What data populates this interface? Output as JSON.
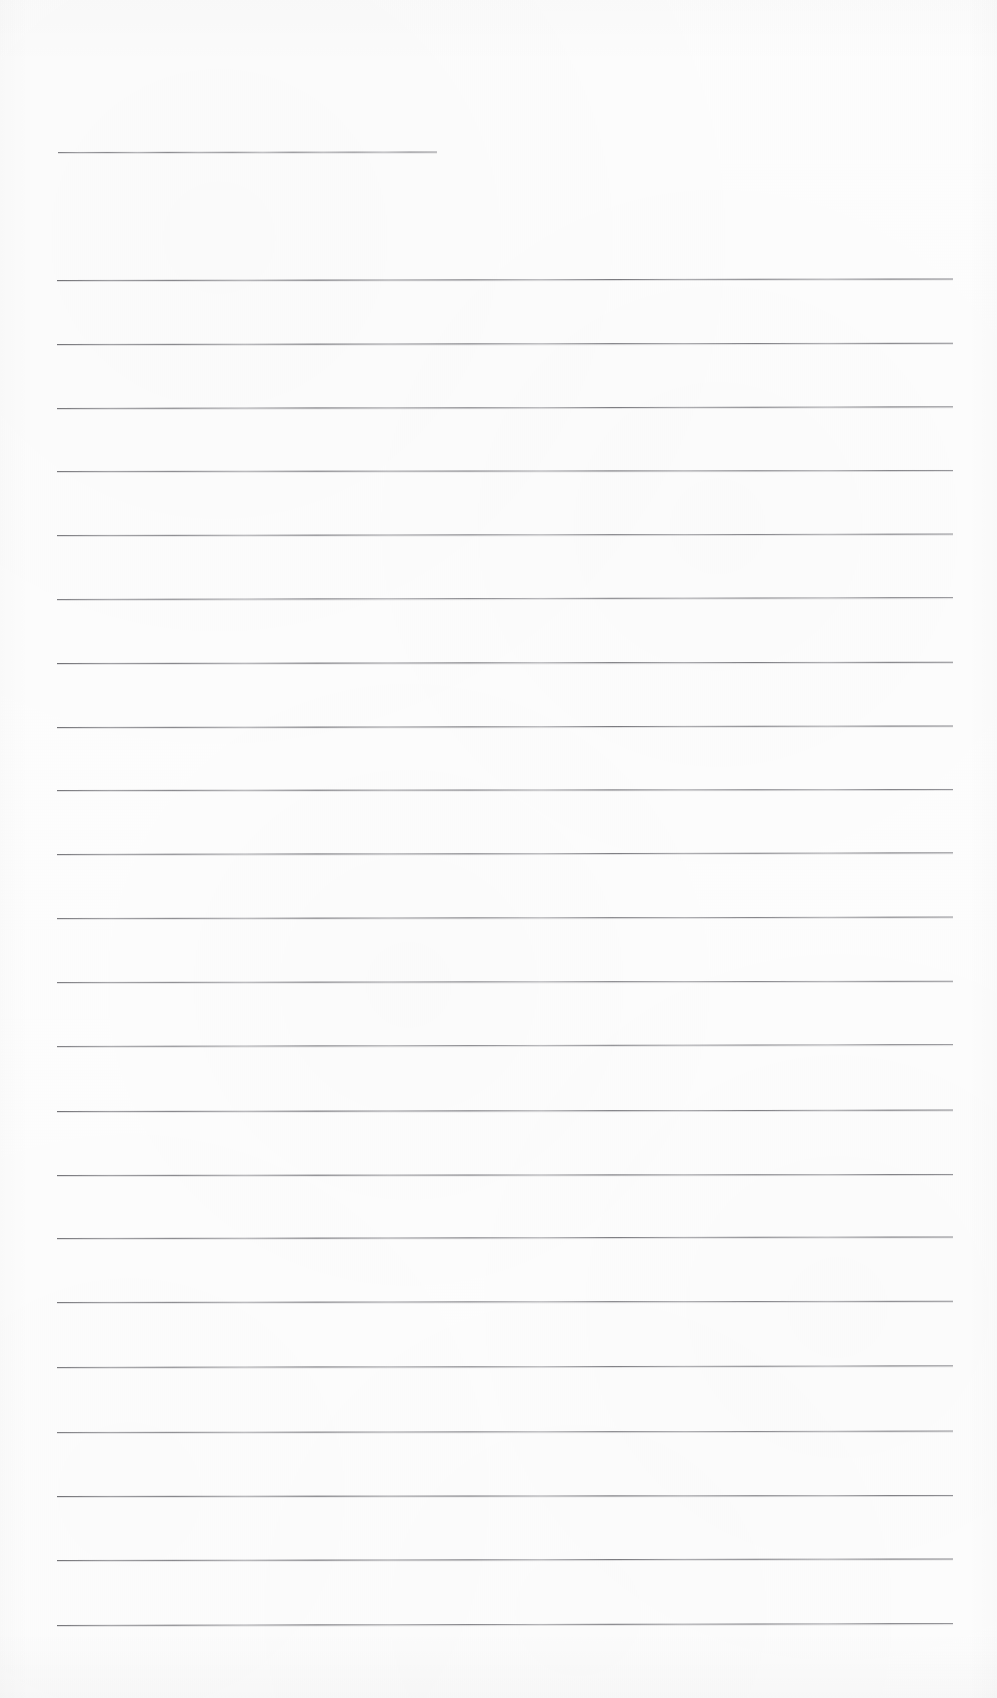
{
  "document": {
    "type": "scanned-lined-paper",
    "title": "Blank ruled notebook page",
    "page_width": 997,
    "page_height": 1698,
    "background_color": "#fdfdfd",
    "rule_color": "#6a6a70",
    "content_text": "",
    "text_lines": [],
    "notes": "Blank scanned sheet of ruled writing paper. No handwriting, printed text, headings, numbers or marks are present."
  },
  "ruling": {
    "left_margin_x": 57,
    "right_margin_x": 953,
    "line_spacing": 63.7,
    "first_line_is_short": true,
    "short_line": {
      "x": 58,
      "y": 152,
      "width": 379
    },
    "full_line_count": 22,
    "full_line_start_y": 280,
    "lines": [
      {
        "index": 0,
        "y": 152,
        "x": 58,
        "width": 379,
        "full": false,
        "tilt": -0.06
      },
      {
        "index": 1,
        "y": 280,
        "x": 57,
        "width": 896,
        "full": true,
        "tilt": -0.1
      },
      {
        "index": 2,
        "y": 344,
        "x": 57,
        "width": 896,
        "full": true,
        "tilt": -0.08
      },
      {
        "index": 3,
        "y": 408,
        "x": 57,
        "width": 896,
        "full": true,
        "tilt": -0.11
      },
      {
        "index": 4,
        "y": 471,
        "x": 57,
        "width": 896,
        "full": true,
        "tilt": -0.07
      },
      {
        "index": 5,
        "y": 535,
        "x": 57,
        "width": 896,
        "full": true,
        "tilt": -0.09
      },
      {
        "index": 6,
        "y": 599,
        "x": 57,
        "width": 896,
        "full": true,
        "tilt": -0.12
      },
      {
        "index": 7,
        "y": 663,
        "x": 57,
        "width": 896,
        "full": true,
        "tilt": -0.08
      },
      {
        "index": 8,
        "y": 727,
        "x": 57,
        "width": 896,
        "full": true,
        "tilt": -0.1
      },
      {
        "index": 9,
        "y": 790,
        "x": 57,
        "width": 896,
        "full": true,
        "tilt": -0.07
      },
      {
        "index": 10,
        "y": 854,
        "x": 57,
        "width": 896,
        "full": true,
        "tilt": -0.11
      },
      {
        "index": 11,
        "y": 918,
        "x": 57,
        "width": 896,
        "full": true,
        "tilt": -0.09
      },
      {
        "index": 12,
        "y": 982,
        "x": 57,
        "width": 896,
        "full": true,
        "tilt": -0.08
      },
      {
        "index": 13,
        "y": 1046,
        "x": 57,
        "width": 896,
        "full": true,
        "tilt": -0.12
      },
      {
        "index": 14,
        "y": 1111,
        "x": 57,
        "width": 896,
        "full": true,
        "tilt": -0.09
      },
      {
        "index": 15,
        "y": 1175,
        "x": 57,
        "width": 896,
        "full": true,
        "tilt": -0.07
      },
      {
        "index": 16,
        "y": 1238,
        "x": 57,
        "width": 896,
        "full": true,
        "tilt": -0.1
      },
      {
        "index": 17,
        "y": 1302,
        "x": 57,
        "width": 896,
        "full": true,
        "tilt": -0.08
      },
      {
        "index": 18,
        "y": 1367,
        "x": 57,
        "width": 896,
        "full": true,
        "tilt": -0.11
      },
      {
        "index": 19,
        "y": 1432,
        "x": 57,
        "width": 896,
        "full": true,
        "tilt": -0.09
      },
      {
        "index": 20,
        "y": 1496,
        "x": 57,
        "width": 896,
        "full": true,
        "tilt": -0.07
      },
      {
        "index": 21,
        "y": 1560,
        "x": 57,
        "width": 896,
        "full": true,
        "tilt": -0.1
      },
      {
        "index": 22,
        "y": 1625,
        "x": 57,
        "width": 896,
        "full": true,
        "tilt": -0.12
      }
    ]
  }
}
